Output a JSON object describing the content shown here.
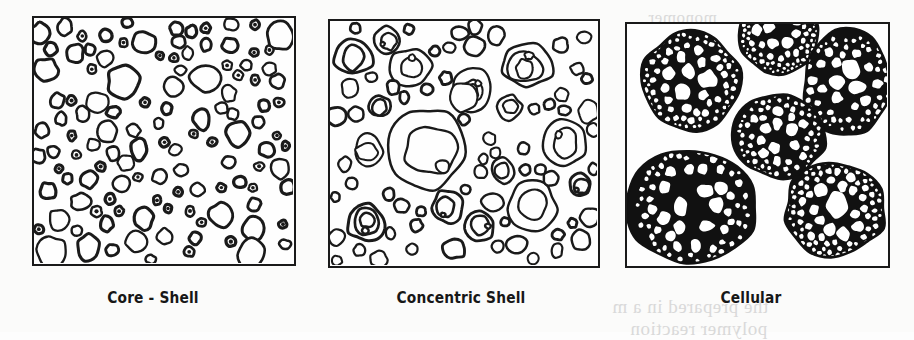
{
  "figure": {
    "background_color": "#fbfbfa",
    "ink_color": "#1a1a1a",
    "caption_color": "#171717",
    "width": 914,
    "height": 332,
    "panel_count": 3
  },
  "panels": [
    {
      "id": "core-shell",
      "caption": "Core - Shell",
      "morphology": "core-shell",
      "frame": {
        "x": 32,
        "y": 16,
        "width": 264,
        "height": 250
      },
      "caption_center_x": 153,
      "caption_y": 288,
      "description": "Dense dispersion of many small ring-shaped particles, each a dark shell enclosing a light core",
      "particle_count": 118,
      "radius_range_px": [
        4,
        15
      ],
      "shell_thickness_px": [
        2.2,
        3.4
      ],
      "ring_levels": 1,
      "fill_fraction": 0.3
    },
    {
      "id": "concentric-shell",
      "caption": "Concentric Shell",
      "morphology": "concentric-shell",
      "frame": {
        "x": 328,
        "y": 19,
        "width": 272,
        "height": 249
      },
      "caption_center_x": 461,
      "caption_y": 288,
      "description": "Fewer, larger particles; many contain two or three nested concentric rings like onion layers",
      "particle_count": 78,
      "radius_range_px": [
        5,
        42
      ],
      "shell_thickness_px": [
        2.0,
        3.0
      ],
      "ring_levels": 3,
      "multi_ring_fraction": 0.42,
      "fill_fraction": 0.34
    },
    {
      "id": "cellular",
      "caption": "Cellular",
      "morphology": "cellular",
      "frame": {
        "x": 625,
        "y": 22,
        "width": 265,
        "height": 246
      },
      "caption_center_x": 751,
      "caption_y": 288,
      "description": "Six large round domains, each packed with a black honeycomb network; cells are large in the middle and become fine near the domain rim",
      "domain_count": 6,
      "domain_radius_range_px": [
        38,
        62
      ],
      "cells_per_domain": [
        60,
        110
      ],
      "wall_color": "#111111",
      "cell_fill_color": "#ffffff",
      "fill_fraction": 0.46
    }
  ],
  "bleed_through_text": [
    {
      "text": "the prepared in a m",
      "x": 612,
      "y": 296,
      "size": 19
    },
    {
      "text": "polymer reaction",
      "x": 630,
      "y": 318,
      "size": 19
    },
    {
      "text": "monomer",
      "x": 648,
      "y": 8,
      "size": 17
    }
  ],
  "icons": {
    "panel_border": "rectangle-frame",
    "core_shell_unit": "ring-icon",
    "concentric_unit": "concentric-rings-icon",
    "cellular_unit": "honeycomb-sphere-icon"
  }
}
